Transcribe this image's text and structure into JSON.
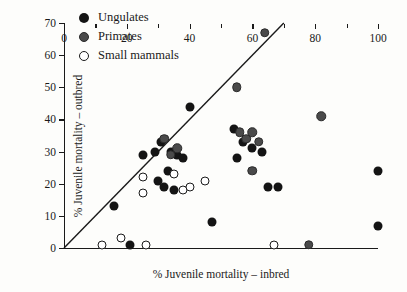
{
  "chart_data": {
    "type": "scatter",
    "title": "",
    "xlabel": "% Juvenile mortality – inbred",
    "ylabel": "% Juvenile mortality – outbred",
    "xlim": [
      0,
      100
    ],
    "ylim": [
      0,
      70
    ],
    "xticks": [
      0,
      20,
      40,
      60,
      80,
      100
    ],
    "xticks_minor": [
      10,
      30,
      50,
      70,
      90
    ],
    "yticks": [
      0,
      10,
      20,
      30,
      40,
      50,
      60,
      70
    ],
    "grid": false,
    "legend_position": "top-left",
    "reference_line": {
      "name": "y = x identity line",
      "from": [
        0,
        0
      ],
      "to": [
        70,
        70
      ]
    },
    "series": [
      {
        "name": "Ungulates",
        "color": "#141414",
        "marker": "filled-circle",
        "points": [
          [
            16,
            13
          ],
          [
            25,
            29
          ],
          [
            29,
            30
          ],
          [
            31,
            33
          ],
          [
            34,
            30
          ],
          [
            36,
            29
          ],
          [
            38,
            28
          ],
          [
            40,
            44
          ],
          [
            30,
            21
          ],
          [
            32,
            19
          ],
          [
            33,
            24
          ],
          [
            35,
            18
          ],
          [
            47,
            8
          ],
          [
            54,
            37
          ],
          [
            55,
            28
          ],
          [
            57,
            33
          ],
          [
            60,
            31
          ],
          [
            63,
            30
          ],
          [
            65,
            19
          ],
          [
            68,
            19
          ],
          [
            21,
            1
          ],
          [
            100,
            24
          ],
          [
            100,
            7
          ]
        ]
      },
      {
        "name": "Primates",
        "color": "#4a4a4a",
        "marker": "filled-gray-circle",
        "points": [
          [
            32,
            34
          ],
          [
            34,
            29
          ],
          [
            55,
            50
          ],
          [
            56,
            36
          ],
          [
            58,
            34
          ],
          [
            60,
            36
          ],
          [
            62,
            33
          ],
          [
            64,
            67
          ],
          [
            82,
            41
          ],
          [
            78,
            1
          ],
          [
            60,
            24
          ],
          [
            36,
            31
          ]
        ]
      },
      {
        "name": "Small mammals",
        "color": "#ffffff",
        "marker": "open-circle",
        "points": [
          [
            25,
            22
          ],
          [
            25,
            17
          ],
          [
            35,
            23
          ],
          [
            38,
            18
          ],
          [
            40,
            19
          ],
          [
            45,
            21
          ],
          [
            12,
            1
          ],
          [
            18,
            3
          ],
          [
            26,
            1
          ],
          [
            67,
            1
          ]
        ]
      }
    ],
    "legend": [
      {
        "label": "Ungulates",
        "marker": "filled-circle"
      },
      {
        "label": "Primates",
        "marker": "filled-gray-circle"
      },
      {
        "label": "Small mammals",
        "marker": "open-circle"
      }
    ]
  }
}
